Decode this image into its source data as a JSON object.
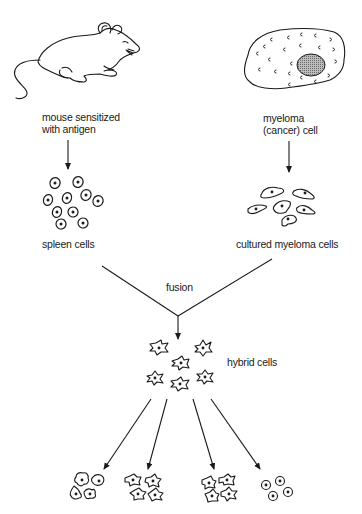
{
  "diagram": {
    "type": "process-flow",
    "nodes": [
      {
        "id": "mouse",
        "icon": "mouse-icon",
        "label_lines": [
          "mouse sensitized",
          "with antigen"
        ]
      },
      {
        "id": "myeloma",
        "icon": "myeloma-cell-icon",
        "label_lines": [
          "myeloma",
          "(cancer) cell"
        ]
      },
      {
        "id": "spleen",
        "icon": "spleen-cells-icon",
        "label": "spleen cells"
      },
      {
        "id": "cultured",
        "icon": "cultured-myeloma-cells-icon",
        "label": "cultured myeloma cells"
      },
      {
        "id": "fusion",
        "label": "fusion"
      },
      {
        "id": "hybrid",
        "icon": "hybrid-cells-icon",
        "label": "hybrid cells"
      },
      {
        "id": "clone1",
        "icon": "clone-cluster-icon"
      },
      {
        "id": "clone2",
        "icon": "clone-cluster-icon"
      },
      {
        "id": "clone3",
        "icon": "clone-cluster-icon"
      },
      {
        "id": "clone4",
        "icon": "clone-cluster-icon"
      }
    ],
    "edges": [
      {
        "from": "mouse",
        "to": "spleen"
      },
      {
        "from": "myeloma",
        "to": "cultured"
      },
      {
        "from": "spleen",
        "to": "fusion"
      },
      {
        "from": "cultured",
        "to": "fusion"
      },
      {
        "from": "fusion",
        "to": "hybrid"
      },
      {
        "from": "hybrid",
        "to": "clone1"
      },
      {
        "from": "hybrid",
        "to": "clone2"
      },
      {
        "from": "hybrid",
        "to": "clone3"
      },
      {
        "from": "hybrid",
        "to": "clone4"
      }
    ]
  },
  "labels": {
    "mouse_line1": "mouse sensitized",
    "mouse_line2": "with antigen",
    "myeloma_line1": "myeloma",
    "myeloma_line2": "(cancer) cell",
    "spleen": "spleen cells",
    "cultured": "cultured myeloma cells",
    "fusion": "fusion",
    "hybrid": "hybrid cells"
  },
  "colors": {
    "ink": "#1a1a1a",
    "background": "#ffffff",
    "nucleus_fill": "#9a9a9a"
  }
}
